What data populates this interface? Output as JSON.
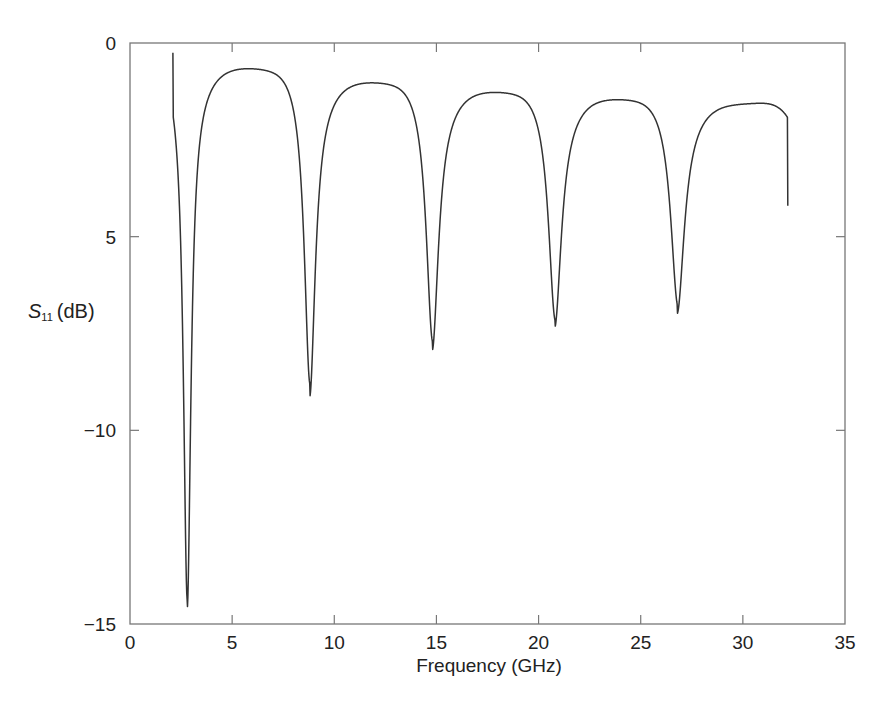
{
  "chart_data": {
    "type": "line",
    "title": "",
    "xlabel": "Frequency (GHz)",
    "ylabel": {
      "symbol": "S",
      "subscript": "11",
      "unit": "(dB)"
    },
    "xlim": [
      0,
      35
    ],
    "ylim": [
      -15,
      0
    ],
    "x_ticks": [
      0,
      5,
      10,
      15,
      20,
      25,
      30,
      35
    ],
    "x_tick_labels": [
      "0",
      "5",
      "10",
      "15",
      "20",
      "25",
      "30",
      "35"
    ],
    "y_ticks": [
      0,
      -5,
      -10,
      -15
    ],
    "y_tick_labels": [
      "0",
      "5",
      "−10",
      "−15"
    ],
    "grid": false,
    "legend": null,
    "line_color": "#333333",
    "series": [
      {
        "name": "S11",
        "x_range": [
          2.1,
          32.2
        ],
        "key_points": [
          {
            "x": 2.1,
            "y": -0.25,
            "note": "curve start"
          },
          {
            "x": 2.8,
            "y": -14.6,
            "note": "dip 1"
          },
          {
            "x": 6.5,
            "y": -0.5,
            "note": "peak 1"
          },
          {
            "x": 8.8,
            "y": -9.1,
            "note": "dip 2"
          },
          {
            "x": 12.4,
            "y": -0.85,
            "note": "peak 2"
          },
          {
            "x": 14.8,
            "y": -7.9,
            "note": "dip 3"
          },
          {
            "x": 18.4,
            "y": -1.1,
            "note": "peak 3"
          },
          {
            "x": 20.8,
            "y": -7.3,
            "note": "dip 4"
          },
          {
            "x": 24.3,
            "y": -1.3,
            "note": "peak 4"
          },
          {
            "x": 26.8,
            "y": -6.95,
            "note": "dip 5"
          },
          {
            "x": 30.3,
            "y": -1.5,
            "note": "peak 5"
          },
          {
            "x": 32.2,
            "y": -4.2,
            "note": "curve end"
          }
        ],
        "dips": [
          {
            "f": 2.8,
            "depth": -14.6,
            "width": 0.22
          },
          {
            "f": 8.8,
            "depth": -9.1,
            "width": 0.32
          },
          {
            "f": 14.8,
            "depth": -7.9,
            "width": 0.36
          },
          {
            "f": 20.8,
            "depth": -7.3,
            "width": 0.38
          },
          {
            "f": 26.8,
            "depth": -6.95,
            "width": 0.4
          }
        ],
        "peaks": [
          {
            "f": 6.5,
            "level": -0.5
          },
          {
            "f": 12.4,
            "level": -0.85
          },
          {
            "f": 18.4,
            "level": -1.1
          },
          {
            "f": 24.3,
            "level": -1.3
          },
          {
            "f": 30.3,
            "level": -1.5
          }
        ]
      }
    ]
  }
}
